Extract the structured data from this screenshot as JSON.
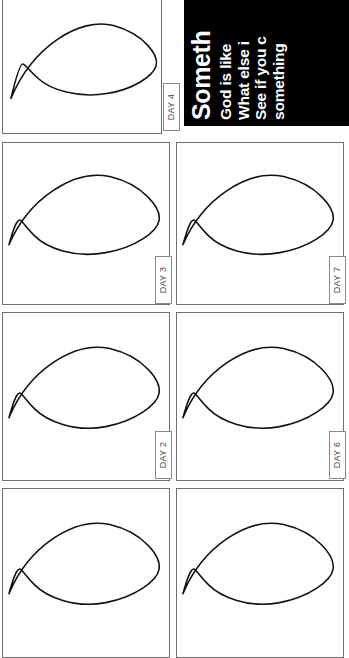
{
  "document": {
    "kind": "printable-worksheet",
    "orientation": "rotated-90",
    "page_background": "#ffffff",
    "ink_color": "#000000",
    "outline_color": "#6e6e6e"
  },
  "text_panel": {
    "background": "#000000",
    "text_color": "#ffffff",
    "heading": "Someth",
    "lines": [
      "God is like",
      "What else i",
      "See if you c",
      "something"
    ]
  },
  "grid": {
    "columns": 2,
    "rows": 4,
    "shape_name": "crescent-leaf-outline"
  },
  "panels": [
    {
      "id": "panel-day-4",
      "day_label": "DAY 4",
      "column": 1,
      "row": 1,
      "has_tab": true
    },
    {
      "id": "panel-day-3",
      "day_label": "DAY 3",
      "column": 1,
      "row": 2,
      "has_tab": true
    },
    {
      "id": "panel-day-7",
      "day_label": "DAY 7",
      "column": 2,
      "row": 2,
      "has_tab": true
    },
    {
      "id": "panel-day-2",
      "day_label": "DAY 2",
      "column": 1,
      "row": 3,
      "has_tab": true
    },
    {
      "id": "panel-day-6",
      "day_label": "DAY 6",
      "column": 2,
      "row": 3,
      "has_tab": true
    },
    {
      "id": "panel-bottom-left",
      "day_label": "",
      "column": 1,
      "row": 4,
      "has_tab": false
    },
    {
      "id": "panel-bottom-right",
      "day_label": "",
      "column": 2,
      "row": 4,
      "has_tab": false
    }
  ]
}
